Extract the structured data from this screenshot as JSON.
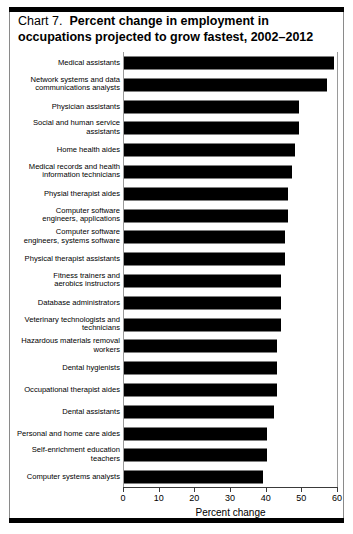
{
  "title": {
    "label": "Chart 7.",
    "main": "Percent change in employment in occupations projected to grow fastest, 2002–2012"
  },
  "chart_data": {
    "type": "bar",
    "orientation": "horizontal",
    "xlabel": "Percent change",
    "ylabel": "",
    "xlim": [
      0,
      60
    ],
    "xticks": [
      0,
      10,
      20,
      30,
      40,
      50,
      60
    ],
    "xtick_labels": [
      "0",
      "10",
      "20",
      "30",
      "40",
      "50",
      "60"
    ],
    "grid": false,
    "legend": false,
    "bar_color": "#000000",
    "categories": [
      "Medical assistants",
      "Network systems and data\ncommunications analysts",
      "Physician assistants",
      "Social and human service\nassistants",
      "Home health aides",
      "Medical records and health\ninformation technicians",
      "Physial therapist aides",
      "Computer software\nengineers, applications",
      "Computer software\nengineers, systems software",
      "Physical therapist assistants",
      "Fitness trainers and\naerobics instructors",
      "Database administrators",
      "Veterinary technologists and\ntechnicians",
      "Hazardous materials removal\nworkers",
      "Dental hygienists",
      "Occupational therapist aides",
      "Dental assistants",
      "Personal and home care aides",
      "Self-enrichment education\nteachers",
      "Computer systems analysts"
    ],
    "values": [
      59,
      57,
      49,
      49,
      48,
      47,
      46,
      46,
      45,
      45,
      44,
      44,
      44,
      43,
      43,
      43,
      42,
      40,
      40,
      39
    ]
  }
}
